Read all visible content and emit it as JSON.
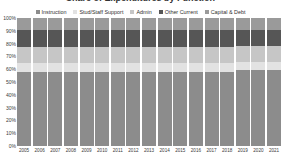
{
  "title": "Share of Expenditures by Function",
  "legend": {
    "position": "top",
    "items": [
      {
        "label": "Instruction",
        "color": "#8c8c8c",
        "icon": "legend-square-icon"
      },
      {
        "label": "Stud/Staff Support",
        "color": "#e2e2e2",
        "icon": "legend-square-icon"
      },
      {
        "label": "Admin",
        "color": "#c6c6c6",
        "icon": "legend-square-icon"
      },
      {
        "label": "Other Current",
        "color": "#565656",
        "icon": "legend-square-icon"
      },
      {
        "label": "Capital & Debt",
        "color": "#9a9a9a",
        "icon": "legend-square-icon"
      }
    ]
  },
  "y_axis": {
    "label": "",
    "ticks": [
      "100%",
      "90%",
      "80%",
      "70%",
      "60%",
      "50%",
      "40%",
      "30%",
      "20%",
      "10%",
      "0%"
    ],
    "min": 0,
    "max": 100
  },
  "x_axis": {
    "label": "",
    "ticks": [
      "2005",
      "2006",
      "2007",
      "2008",
      "2009",
      "2010",
      "2011",
      "2012",
      "2013",
      "2014",
      "2015",
      "2016",
      "2017",
      "2018",
      "2019",
      "2020",
      "2021"
    ]
  },
  "chart_data": {
    "type": "bar",
    "stacked": true,
    "stack_total": 100,
    "orientation": "vertical",
    "title": "Share of Expenditures by Function",
    "xlabel": "",
    "ylabel": "",
    "ylim": [
      0,
      100
    ],
    "grid": false,
    "legend_position": "top",
    "categories": [
      "2005",
      "2006",
      "2007",
      "2008",
      "2009",
      "2010",
      "2011",
      "2012",
      "2013",
      "2014",
      "2015",
      "2016",
      "2017",
      "2018",
      "2019",
      "2020",
      "2021"
    ],
    "stack_order_bottom_to_top": [
      "Instruction",
      "Stud/Staff Support",
      "Admin",
      "Other Current",
      "Capital & Debt"
    ],
    "series": [
      {
        "name": "Instruction",
        "color": "#8c8c8c",
        "values": [
          58,
          58,
          58,
          58,
          58,
          58,
          58,
          58,
          58,
          58,
          58,
          58,
          58,
          58,
          59,
          59,
          59
        ]
      },
      {
        "name": "Stud/Staff Support",
        "color": "#e2e2e2",
        "values": [
          7,
          7,
          7,
          7,
          7,
          7,
          7,
          7,
          7,
          7,
          7,
          7,
          7,
          7,
          7,
          7,
          7
        ]
      },
      {
        "name": "Admin",
        "color": "#c6c6c6",
        "values": [
          12,
          12,
          12,
          12,
          12,
          12,
          12,
          12,
          12,
          12,
          12,
          12,
          12,
          12,
          12,
          12,
          12
        ]
      },
      {
        "name": "Other Current",
        "color": "#565656",
        "values": [
          14,
          14,
          14,
          14,
          14,
          14,
          14,
          14,
          14,
          14,
          14,
          14,
          14,
          14,
          13,
          13,
          13
        ]
      },
      {
        "name": "Capital & Debt",
        "color": "#9a9a9a",
        "values": [
          9,
          9,
          9,
          9,
          9,
          9,
          9,
          9,
          9,
          9,
          9,
          9,
          9,
          9,
          9,
          9,
          9
        ]
      }
    ]
  }
}
